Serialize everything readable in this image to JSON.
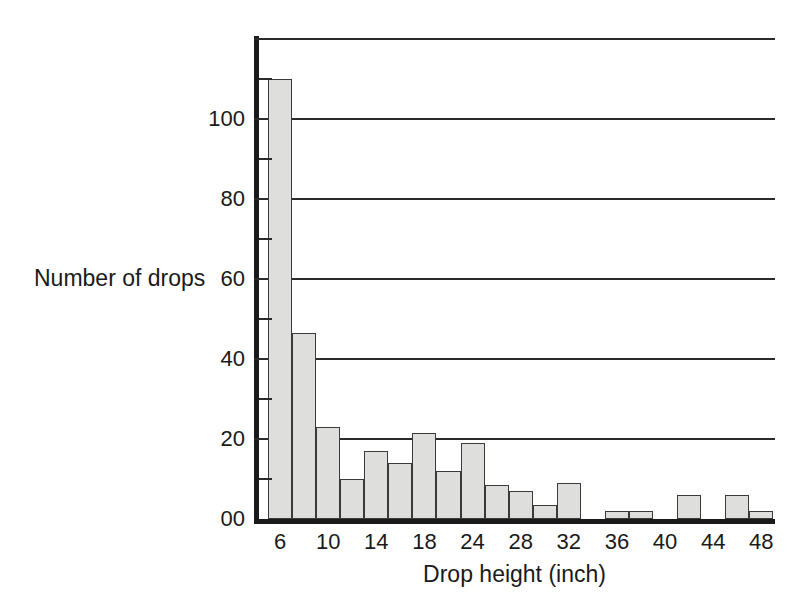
{
  "chart_data": {
    "type": "bar",
    "title": "",
    "subtitle": "",
    "xlabel": "Drop height (inch)",
    "ylabel": "Number of drops",
    "grid": "horizontal-major-only",
    "legend": null,
    "xlim": [
      0,
      21
    ],
    "ylim": [
      0,
      120
    ],
    "y_major_ticks": [
      0,
      20,
      40,
      60,
      80,
      100,
      120
    ],
    "y_major_tick_labels": [
      "00",
      "20",
      "40",
      "60",
      "80",
      "100",
      ""
    ],
    "y_minor_ticks": [
      10,
      30,
      50,
      70,
      90,
      110
    ],
    "x_tick_labels": [
      "6",
      "10",
      "14",
      "18",
      "24",
      "28",
      "32",
      "36",
      "40",
      "44",
      "48"
    ],
    "x_tick_bar_index": [
      0,
      2,
      4,
      6,
      8,
      10,
      12,
      14,
      16,
      18,
      20
    ],
    "bin_width": 2,
    "categories": [
      "6",
      "8",
      "10",
      "12",
      "14",
      "16",
      "18",
      "20",
      "24",
      "26",
      "28",
      "30",
      "32",
      "34",
      "36",
      "38",
      "40",
      "42",
      "44",
      "46",
      "48"
    ],
    "values": [
      110,
      46.5,
      23,
      10,
      17,
      14,
      21.5,
      12,
      19,
      8.5,
      7,
      3.5,
      9,
      0,
      2,
      2,
      0,
      6,
      0,
      6,
      2
    ],
    "colors": {
      "bar_fill": "#dededc",
      "bar_edge": "#3a3a3a",
      "axis": "#1a1a1a",
      "gridline": "#2b2b2b",
      "background": "#ffffff",
      "text": "#1a1a1a"
    }
  }
}
